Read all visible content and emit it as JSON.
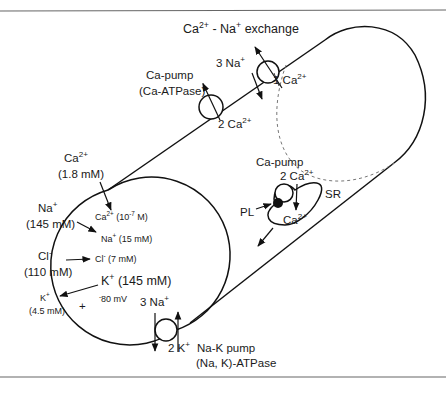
{
  "diagram": {
    "exchanger": {
      "label": "Ca2+ - Na+ exchange",
      "label_parts": {
        "a": "Ca",
        "a_sup": "2+",
        "mid": " - Na",
        "mid_sup": "+",
        "end": " exchange"
      },
      "in_ion": {
        "text": "3 Na",
        "sup": "+"
      },
      "out_ion": {
        "text": "1 Ca",
        "sup": "2+"
      }
    },
    "ca_pump": {
      "line1": "Ca-pump",
      "line2": "(Ca-ATPase)",
      "ion": {
        "text": "2 Ca",
        "sup": "2+"
      }
    },
    "extracellular": {
      "ca": {
        "ion": "Ca",
        "sup": "2+",
        "conc": "(1.8 mM)"
      },
      "na": {
        "ion": "Na",
        "sup": "+",
        "conc": "(145 mM)"
      },
      "cl": {
        "ion": "Cl",
        "sup": "-",
        "conc": "(110 mM)"
      },
      "k": {
        "ion": "K",
        "sup": "+",
        "conc": "(4.5 mM)"
      },
      "charge": "+"
    },
    "intracellular": {
      "ca": {
        "ion": "Ca",
        "sup": "2+",
        "conc_pre": " (10",
        "conc_sup": "-7",
        "conc_post": " M)"
      },
      "na": {
        "ion": "Na",
        "sup": "+",
        "conc": " (15 mM)"
      },
      "cl": {
        "ion": "Cl",
        "sup": "-",
        "conc": " (7 mM)"
      },
      "k": {
        "ion": "K",
        "sup": "+",
        "conc": " (145 mM)"
      },
      "potential": {
        "sup": "-",
        "text": "80 mV"
      }
    },
    "sr": {
      "label": "SR",
      "pump_label": "Ca-pump",
      "pump_ion": {
        "text": "2 Ca",
        "sup": "2+"
      },
      "pl_label": "PL",
      "lumen_ion": {
        "text": "Ca",
        "sup": "2+"
      }
    },
    "na_k_pump": {
      "na_ion": {
        "text": "3 Na",
        "sup": "+"
      },
      "k_ion": {
        "text": "2 K",
        "sup": "+"
      },
      "line1": "Na-K pump",
      "line2": "(Na, K)-ATPase"
    }
  }
}
